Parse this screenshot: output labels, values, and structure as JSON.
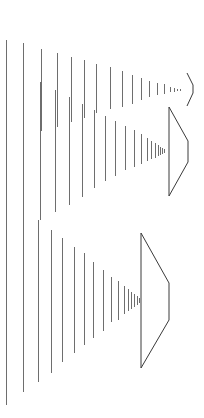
{
  "figure": {
    "colors": {
      "background": "#ffffff",
      "lines": "#6e6e6e",
      "shapes": "#3a3a3a"
    },
    "full_lines": [
      {
        "x": 6,
        "y1": 40,
        "y2": 405
      },
      {
        "x": 23,
        "y1": 43,
        "y2": 392
      }
    ],
    "groups": [
      {
        "name": "group-a-top",
        "lines": [
          {
            "x": 41,
            "y1": 49,
            "y2": 131
          },
          {
            "x": 57,
            "y1": 53,
            "y2": 127
          },
          {
            "x": 71,
            "y1": 57,
            "y2": 122
          },
          {
            "x": 84,
            "y1": 60,
            "y2": 118
          },
          {
            "x": 96,
            "y1": 64,
            "y2": 113
          },
          {
            "x": 110,
            "y1": 67,
            "y2": 109
          },
          {
            "x": 122,
            "y1": 71,
            "y2": 107
          },
          {
            "x": 132,
            "y1": 75,
            "y2": 104
          },
          {
            "x": 141,
            "y1": 78,
            "y2": 100
          },
          {
            "x": 149,
            "y1": 81,
            "y2": 97
          },
          {
            "x": 157,
            "y1": 83,
            "y2": 95
          },
          {
            "x": 164,
            "y1": 84,
            "y2": 94
          },
          {
            "x": 170,
            "y1": 87,
            "y2": 92
          },
          {
            "x": 174,
            "y1": 88,
            "y2": 92
          },
          {
            "x": 177,
            "y1": 89,
            "y2": 91
          },
          {
            "x": 180,
            "y1": 89,
            "y2": 91
          }
        ],
        "shape": "187,73 193,85 193,93 187,106"
      },
      {
        "name": "group-b-middle",
        "lines": [
          {
            "x": 40,
            "y1": 82,
            "y2": 220
          },
          {
            "x": 55,
            "y1": 90,
            "y2": 212
          },
          {
            "x": 69,
            "y1": 97,
            "y2": 205
          },
          {
            "x": 82,
            "y1": 104,
            "y2": 197
          },
          {
            "x": 94,
            "y1": 110,
            "y2": 188
          },
          {
            "x": 105,
            "y1": 116,
            "y2": 181
          },
          {
            "x": 115,
            "y1": 121,
            "y2": 176
          },
          {
            "x": 125,
            "y1": 126,
            "y2": 170
          },
          {
            "x": 134,
            "y1": 130,
            "y2": 167
          },
          {
            "x": 141,
            "y1": 134,
            "y2": 164
          },
          {
            "x": 147,
            "y1": 138,
            "y2": 161
          },
          {
            "x": 151,
            "y1": 141,
            "y2": 159
          },
          {
            "x": 155,
            "y1": 143,
            "y2": 158
          },
          {
            "x": 158,
            "y1": 145,
            "y2": 156
          },
          {
            "x": 160,
            "y1": 147,
            "y2": 155
          },
          {
            "x": 162,
            "y1": 148,
            "y2": 154
          },
          {
            "x": 164,
            "y1": 149,
            "y2": 153
          }
        ],
        "shape": "169,107 188,141 188,162 169,196 169,107"
      },
      {
        "name": "group-c-bottom",
        "lines": [
          {
            "x": 38,
            "y1": 220,
            "y2": 382
          },
          {
            "x": 51,
            "y1": 230,
            "y2": 373
          },
          {
            "x": 62,
            "y1": 238,
            "y2": 362
          },
          {
            "x": 74,
            "y1": 247,
            "y2": 353
          },
          {
            "x": 84,
            "y1": 253,
            "y2": 345
          },
          {
            "x": 93,
            "y1": 262,
            "y2": 338
          },
          {
            "x": 103,
            "y1": 270,
            "y2": 331
          },
          {
            "x": 111,
            "y1": 277,
            "y2": 322
          },
          {
            "x": 118,
            "y1": 281,
            "y2": 320
          },
          {
            "x": 124,
            "y1": 286,
            "y2": 314
          },
          {
            "x": 128,
            "y1": 289,
            "y2": 311
          },
          {
            "x": 131,
            "y1": 292,
            "y2": 309
          },
          {
            "x": 134,
            "y1": 294,
            "y2": 307
          },
          {
            "x": 137,
            "y1": 296,
            "y2": 305
          },
          {
            "x": 139,
            "y1": 298,
            "y2": 303
          }
        ],
        "shape": "141,233 169,283 169,320 141,368 141,233"
      }
    ]
  }
}
